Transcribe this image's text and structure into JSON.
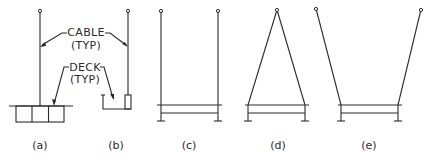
{
  "diagram": {
    "type": "suspension cable and deck configurations",
    "callouts": {
      "cable": {
        "line1": "CABLE",
        "line2": "(TYP)"
      },
      "deck": {
        "line1": "DECK",
        "line2": "(TYP)"
      }
    },
    "panels": [
      {
        "id": "a",
        "label": "(a)",
        "description": "single vertical cable to multi-cell box deck"
      },
      {
        "id": "b",
        "label": "(b)",
        "description": "single vertical cable to channel deck with post"
      },
      {
        "id": "c",
        "label": "(c)",
        "description": "two vertical parallel cables to deck"
      },
      {
        "id": "d",
        "label": "(d)",
        "description": "two cables converging to single apex anchor (A-frame)"
      },
      {
        "id": "e",
        "label": "(e)",
        "description": "two cables diverging outward to separate anchors (V-shape)"
      }
    ],
    "colors": {
      "line": "#2a2a2a",
      "background": "#ffffff"
    }
  }
}
